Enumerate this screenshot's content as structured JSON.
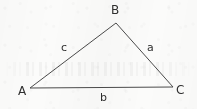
{
  "figure": {
    "background_color": "#fbfbfa",
    "stroke_color": "#4a4a4a",
    "text_color": "#2f2f2f",
    "stroke_width": 1,
    "vertices": [
      {
        "name": "A",
        "label": "A",
        "x": 30,
        "y": 88,
        "label_x": 18,
        "label_y": 85
      },
      {
        "name": "B",
        "label": "B",
        "x": 116,
        "y": 23,
        "label_x": 111,
        "label_y": 4
      },
      {
        "name": "C",
        "label": "C",
        "x": 173,
        "y": 87,
        "label_x": 176,
        "label_y": 84
      }
    ],
    "sides": [
      {
        "name": "a",
        "label": "a",
        "from": "B",
        "to": "C",
        "label_x": 147,
        "label_y": 42
      },
      {
        "name": "b",
        "label": "b",
        "from": "A",
        "to": "C",
        "label_x": 100,
        "label_y": 92
      },
      {
        "name": "c",
        "label": "c",
        "from": "A",
        "to": "B",
        "label_x": 61,
        "label_y": 42
      }
    ]
  }
}
